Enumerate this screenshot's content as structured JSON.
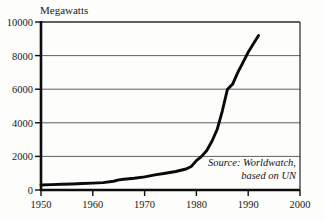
{
  "chart_data": {
    "type": "line",
    "title": "Megawatts",
    "xlabel": "",
    "ylabel": "Megawatts",
    "xlim": [
      1950,
      2000
    ],
    "ylim": [
      0,
      10000
    ],
    "grid": true,
    "legend": null,
    "yticks": [
      0,
      2000,
      4000,
      6000,
      8000,
      10000
    ],
    "ytick_labels": [
      "0",
      "2000",
      "4000",
      "6000",
      "8000",
      "10000"
    ],
    "xticks": [
      1950,
      1960,
      1970,
      1980,
      1990,
      2000
    ],
    "xtick_labels": [
      "1950",
      "1960",
      "1970",
      "1980",
      "1990",
      "2000"
    ],
    "annotations": [
      {
        "line1": "Source: Worldwatch,",
        "line2": "based on UN"
      }
    ],
    "series": [
      {
        "name": "World wind/installed capacity",
        "x": [
          1950,
          1952,
          1954,
          1956,
          1958,
          1960,
          1962,
          1964,
          1965,
          1966,
          1968,
          1970,
          1972,
          1974,
          1976,
          1978,
          1979,
          1980,
          1981,
          1982,
          1983,
          1984,
          1985,
          1986,
          1987,
          1988,
          1989,
          1990,
          1991,
          1992
        ],
        "values": [
          300,
          320,
          340,
          360,
          385,
          410,
          440,
          520,
          600,
          640,
          700,
          780,
          900,
          1000,
          1100,
          1250,
          1400,
          1750,
          2000,
          2350,
          2900,
          3600,
          4700,
          6000,
          6300,
          7000,
          7600,
          8200,
          8700,
          9200
        ]
      }
    ]
  },
  "colors": {
    "background": "#fdfdfc",
    "line": "#0a0a0a",
    "grid": "#4f4f4f",
    "frame": "#111111",
    "text": "#1a1a1a"
  }
}
